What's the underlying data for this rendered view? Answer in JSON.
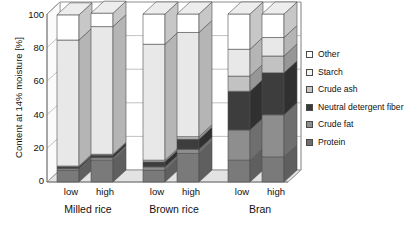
{
  "chart_data": {
    "type": "bar",
    "subtype": "stacked-column-3d",
    "title": "",
    "xlabel": "",
    "ylabel": "Content at 14% moisture [%]",
    "ylim": [
      0,
      100
    ],
    "yticks": [
      0,
      20,
      40,
      60,
      80,
      100
    ],
    "grid": true,
    "legend_position": "right",
    "groups": [
      "Milled rice",
      "Brown rice",
      "Bran"
    ],
    "categories": [
      "low",
      "high",
      "low",
      "high",
      "low",
      "high"
    ],
    "category_group_map": [
      "Milled rice",
      "Milled rice",
      "Brown rice",
      "Brown rice",
      "Bran",
      "Bran"
    ],
    "stack_order_bottom_to_top": [
      "Protein",
      "Crude fat",
      "Neutral detergent fiber",
      "Crude ash",
      "Starch",
      "Other"
    ],
    "series": [
      {
        "name": "Protein",
        "color": "#7a7a7a",
        "values": [
          7,
          13,
          7,
          17,
          13,
          15
        ]
      },
      {
        "name": "Crude fat",
        "color": "#8e8e8e",
        "values": [
          1,
          1.5,
          2,
          2.5,
          18,
          25
        ]
      },
      {
        "name": "Neutral detergent fiber",
        "color": "#3d3d3d",
        "values": [
          1,
          1.5,
          3,
          6,
          23,
          25
        ]
      },
      {
        "name": "Crude ash",
        "color": "#c2c2c2",
        "values": [
          0.5,
          0.5,
          1,
          1.5,
          9,
          10
        ]
      },
      {
        "name": "Starch",
        "color": "#e8e8e8",
        "values": [
          75,
          76,
          69,
          62,
          16,
          11
        ]
      },
      {
        "name": "Other",
        "color": "#ffffff",
        "values": [
          15,
          8,
          18,
          11,
          21,
          14
        ]
      }
    ]
  },
  "axis": {
    "tick_labels": [
      "100",
      "80",
      "60",
      "40",
      "20",
      "0"
    ],
    "y_title": "Content at 14% moisture [%]"
  },
  "xaxis": {
    "category_labels": [
      "low",
      "high",
      "low",
      "high",
      "low",
      "high"
    ],
    "group_labels": [
      "Milled rice",
      "Brown rice",
      "Bran"
    ]
  },
  "legend": {
    "items": [
      {
        "label": "Other",
        "color": "#ffffff"
      },
      {
        "label": "Starch",
        "color": "#f2f2f2"
      },
      {
        "label": "Crude ash",
        "color": "#c6c6c6"
      },
      {
        "label": "Neutral detergent fiber",
        "color": "#3a3a3a"
      },
      {
        "label": "Crude fat",
        "color": "#8e8e8e"
      },
      {
        "label": "Protein",
        "color": "#6e6e6e"
      }
    ]
  }
}
